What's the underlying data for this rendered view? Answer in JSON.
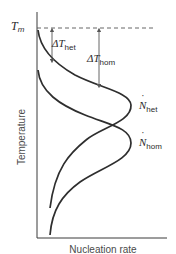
{
  "figure": {
    "axes": {
      "x_label": "Nucleation rate",
      "y_label": "Temperature"
    },
    "melting_point": {
      "symbol": "T",
      "subscript": "m"
    },
    "undercooling": {
      "het": {
        "symbol": "ΔT",
        "subscript": "het"
      },
      "hom": {
        "symbol": "ΔT",
        "subscript": "hom"
      }
    },
    "curves": {
      "het": {
        "symbol": "N",
        "subscript": "het"
      },
      "hom": {
        "symbol": "N",
        "subscript": "hom"
      }
    },
    "colors": {
      "curve": "#2e2e2e",
      "axis": "#3a3a3a",
      "dashed": "#555555",
      "arrow": "#555555",
      "text": "#2b2b2b"
    }
  }
}
